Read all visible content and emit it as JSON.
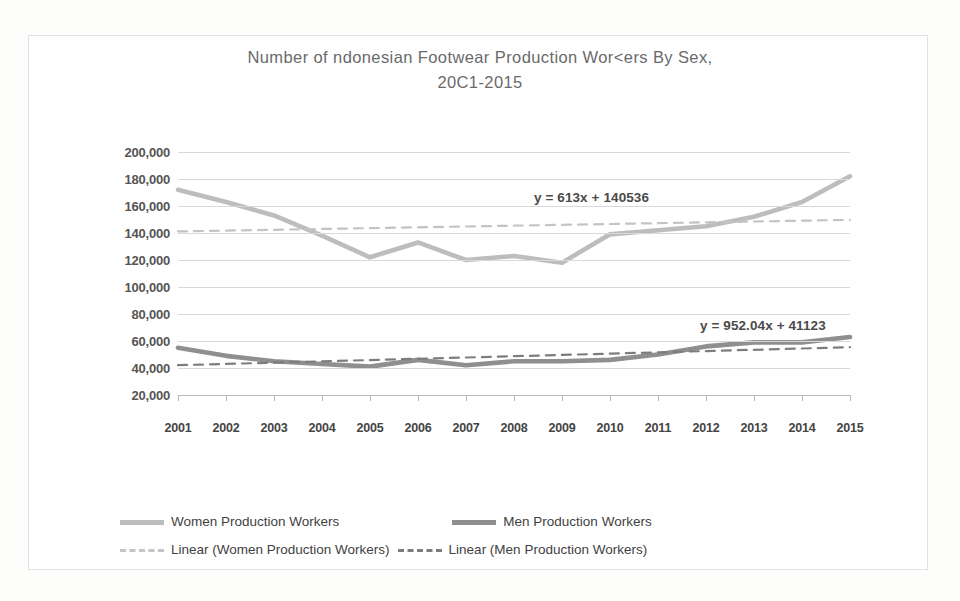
{
  "chart_data": {
    "type": "line",
    "title": "Number of  ndonesian Footwear Production Wor<ers By Sex,",
    "title_line2": "20C1-2015",
    "xlabel": "",
    "ylabel": "",
    "x": [
      2001,
      2002,
      2003,
      2004,
      2005,
      2006,
      2007,
      2008,
      2009,
      2010,
      2011,
      2012,
      2013,
      2014,
      2015
    ],
    "categories": [
      "2001",
      "2002",
      "2003",
      "2004",
      "2005",
      "2006",
      "2007",
      "2008",
      "2009",
      "2010",
      "2011",
      "2012",
      "2013",
      "2014",
      "2015"
    ],
    "ylim": [
      0,
      200000
    ],
    "yticks": [
      200000,
      180000,
      160000,
      140000,
      120000,
      100000,
      80000,
      60000,
      40000,
      20000
    ],
    "ytick_labels": [
      "200,000",
      "180,000",
      "160,000",
      "140,000",
      "120,000",
      "100,000",
      "80,000",
      "60,000",
      "40,000",
      "20,000"
    ],
    "grid": true,
    "legend_position": "bottom",
    "series": [
      {
        "name": "Women Production Workers",
        "style": "solid",
        "color": "#bdbdbd",
        "values": [
          172000,
          163000,
          153000,
          138000,
          122000,
          133000,
          120000,
          123000,
          118000,
          139000,
          142000,
          145000,
          152000,
          163000,
          182000
        ]
      },
      {
        "name": "Men Production Workers",
        "style": "solid",
        "color": "#8f8f8f",
        "values": [
          55000,
          49000,
          45000,
          43000,
          41000,
          46000,
          42000,
          45000,
          45000,
          46000,
          50000,
          56000,
          59000,
          59000,
          63000
        ]
      },
      {
        "name": "Linear (Women Production Workers)",
        "style": "dashed",
        "color": "#c4c4c4",
        "trendline_for": "Women Production Workers",
        "equation": "y = 613x + 140536",
        "slope": 613,
        "intercept": 140536,
        "values": [
          141149,
          141762,
          142375,
          142988,
          143601,
          144214,
          144827,
          145440,
          146053,
          146666,
          147279,
          147892,
          148505,
          149118,
          149731
        ]
      },
      {
        "name": "Linear (Men Production Workers)",
        "style": "dashed",
        "color": "#7d7d7d",
        "trendline_for": "Men Production Workers",
        "equation": "y = 952.04x + 41123",
        "slope": 952.04,
        "intercept": 41123,
        "values": [
          42075,
          43027,
          43979,
          44931,
          45883,
          46835,
          47787,
          48739,
          49692,
          50644,
          51596,
          52548,
          53500,
          54452,
          55404
        ]
      }
    ],
    "annotations": [
      {
        "text": "y = 613x + 140536",
        "for": "Linear (Women Production Workers)"
      },
      {
        "text": "y = 952.04x + 41123",
        "for": "Linear (Men Production Workers)"
      }
    ]
  },
  "legend": {
    "entries": [
      {
        "label": "Women Production Workers",
        "swatch": "solid-women"
      },
      {
        "label": "Men Production Workers",
        "swatch": "solid-men"
      },
      {
        "label": "Linear (Women Production Workers)",
        "swatch": "dash-women"
      },
      {
        "label": "Linear (Men Production Workers)",
        "swatch": "dash-men"
      }
    ]
  },
  "colors": {
    "women_line": "#bdbdbd",
    "men_line": "#8f8f8f",
    "women_trend": "#c4c4c4",
    "men_trend": "#7d7d7d",
    "gridline": "#d9d9d9",
    "axis": "#b9b9b9",
    "title_text": "#6a6a6a",
    "label_text": "#444444",
    "frame": "#e2e2e2"
  }
}
